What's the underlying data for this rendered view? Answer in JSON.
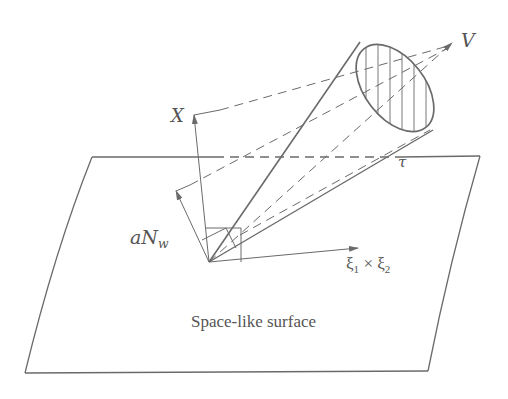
{
  "diagram": {
    "colors": {
      "line": "#6a6a6a",
      "text": "#555555",
      "background": "#ffffff"
    },
    "labels": {
      "V": "V",
      "X": "X",
      "tau": "τ",
      "aNw_main": "aN",
      "aNw_sub": "w",
      "xi_cross_1": "ξ",
      "xi_cross_1_sub": "1",
      "xi_cross_op": " × ",
      "xi_cross_2": "ξ",
      "xi_cross_2_sub": "2",
      "surface": "Space-like surface"
    }
  }
}
